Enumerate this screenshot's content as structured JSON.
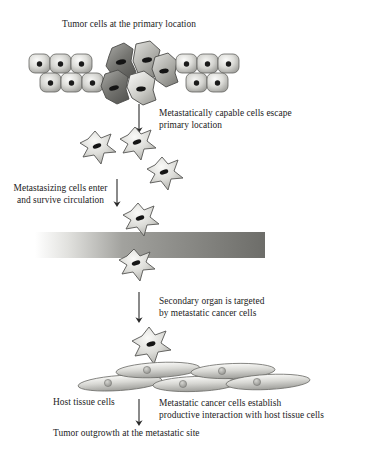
{
  "diagram": {
    "type": "biological-process-flow",
    "background_color": "#ffffff",
    "text_color": "#1c1c1c"
  },
  "labels": {
    "primary_tumor": "Tumor cells at the primary location",
    "escape": "Metastatically capable cells escape\nprimary location",
    "circulation": "Metastasizing cells enter\nand survive circulation",
    "secondary_organ": "Secondary organ is targeted\nby metastatic cancer cells",
    "host_tissue": "Host tissue cells",
    "interaction": "Metastatic cancer cells establish\nproductive interaction with host tissue cells",
    "outgrowth": "Tumor outgrowth at the metastatic site"
  },
  "stages": [
    {
      "id": "primary-tumor",
      "label": "Tumor cells at the primary location",
      "order": 1
    },
    {
      "id": "escape",
      "label": "Metastatically capable cells escape primary location",
      "order": 2
    },
    {
      "id": "intravasation",
      "label": "Metastasizing cells enter and survive circulation",
      "order": 3
    },
    {
      "id": "secondary-organ",
      "label": "Secondary organ is targeted by metastatic cancer cells",
      "order": 4
    },
    {
      "id": "interaction",
      "label": "Metastatic cancer cells establish productive interaction with host tissue cells",
      "order": 5
    },
    {
      "id": "outgrowth",
      "label": "Tumor outgrowth at the metastatic site",
      "order": 6
    }
  ],
  "colors": {
    "epithelial_cell_light": "#f2f2f0",
    "epithelial_cell_mid": "#c6c6c2",
    "epithelial_cell_edge": "#8e8e8a",
    "epithelial_outline": "#5a5a57",
    "nucleus_dark": "#1a1a1a",
    "tumor_cell_dark": "#6e6e6a",
    "tumor_cell_light": "#dcdcd8",
    "star_cell_light": "#eeeeea",
    "star_cell_mid": "#c0c0bb",
    "star_outline": "#555552",
    "vessel_left": "#fbfbfb",
    "vessel_mid": "#9a9a96",
    "vessel_right": "#6e6e6a",
    "host_cell_light": "#efefec",
    "host_cell_mid": "#b6b6b1",
    "host_nucleus": "#a8a8a3",
    "arrow": "#2a2a2a"
  },
  "vessel": {
    "name": "blood-vessel",
    "x": 35,
    "y": 232,
    "width": 230,
    "height": 26,
    "orientation": "horizontal"
  },
  "cell_counts": {
    "epithelial_left_top": 3,
    "epithelial_left_bottom": 3,
    "epithelial_right_top": 3,
    "epithelial_right_bottom": 2,
    "tumor_cells_center": 5,
    "escaping_star_cells": 3,
    "circulating_star_cells": 2,
    "host_tissue_cells": 5,
    "metastatic_star_final": 1
  },
  "arrows": [
    {
      "name": "arrow-escape",
      "x": 139,
      "y1": 103,
      "y2": 131
    },
    {
      "name": "arrow-circulation",
      "x": 117,
      "y1": 178,
      "y2": 205
    },
    {
      "name": "arrow-secondary",
      "x": 139,
      "y1": 291,
      "y2": 321
    },
    {
      "name": "arrow-outgrowth",
      "x": 139,
      "y1": 398,
      "y2": 424
    }
  ]
}
